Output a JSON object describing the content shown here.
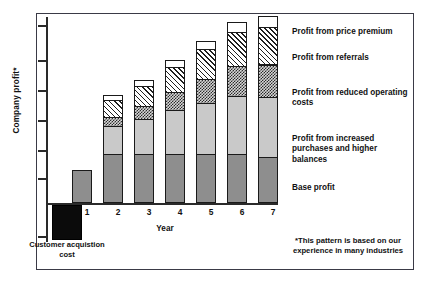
{
  "chart_data": {
    "type": "bar",
    "title": "",
    "subtitle": "",
    "stacked": true,
    "xlabel": "Year",
    "ylabel": "Company profit*",
    "categories": [
      "1",
      "2",
      "3",
      "4",
      "5",
      "6",
      "7"
    ],
    "grid": false,
    "legend_position": "right",
    "ylim": [
      -20,
      150
    ],
    "yticks_labeled": false,
    "ytick_count": 6,
    "series": [
      {
        "name": "Base profit",
        "key": "base",
        "values": [
          28,
          42,
          42,
          42,
          42,
          42,
          42
        ],
        "fill": "solid-dark-gray",
        "color": "#8e8e8e"
      },
      {
        "name": "Profit from increased purchases and higher balances",
        "key": "purchases",
        "values": [
          0,
          24,
          30,
          38,
          44,
          50,
          56
        ],
        "fill": "solid-light-gray",
        "color": "#c9c9c9"
      },
      {
        "name": "Profit from reduced operating costs",
        "key": "opcosts",
        "values": [
          0,
          9,
          12,
          16,
          21,
          26,
          31
        ],
        "fill": "checkerboard",
        "color": "#d6d6d6"
      },
      {
        "name": "Profit from referrals",
        "key": "referrals",
        "values": [
          0,
          15,
          18,
          22,
          26,
          30,
          35
        ],
        "fill": "diagonal-hatch",
        "color": "#ffffff"
      },
      {
        "name": "Profit from price premium",
        "key": "premium",
        "values": [
          0,
          5,
          6,
          7,
          8,
          9,
          11
        ],
        "fill": "white-outline",
        "color": "#ffffff"
      }
    ],
    "negative_bar": {
      "label": "Customer acquistion cost",
      "value": -26,
      "fill": "solid-black",
      "color": "#0b0b0b"
    },
    "annotations": [
      "*This pattern is based on our experience in many industries"
    ]
  },
  "axes": {
    "y_title": "Company profit*",
    "x_title": "Year",
    "x_tick_labels": [
      "1",
      "2",
      "3",
      "4",
      "5",
      "6",
      "7"
    ]
  },
  "legend": {
    "items": [
      {
        "label": "Profit from price premium"
      },
      {
        "label": "Profit from referrals"
      },
      {
        "label": "Profit from reduced operating costs"
      },
      {
        "label": "Profit from increased purchases and higher balances"
      },
      {
        "label": "Base profit"
      }
    ]
  },
  "cost_bar": {
    "label": "Customer acquistion cost"
  },
  "footnote": {
    "text": "*This pattern is based on our experience in many industries"
  },
  "colors": {
    "base_profit": "#8e8e8e",
    "purchases": "#c9c9c9",
    "operating_costs": "#d6d6d6",
    "referrals": "#ffffff",
    "price_premium": "#ffffff",
    "acquisition_cost": "#0b0b0b",
    "axis": "#2a2a2a",
    "frame": "#3a3a46"
  }
}
